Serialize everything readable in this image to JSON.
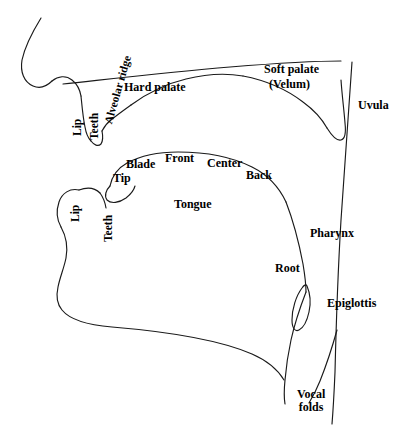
{
  "diagram": {
    "type": "anatomical-line-diagram",
    "background_color": "#ffffff",
    "stroke_color": "#1a1a1a",
    "text_color": "#000000"
  },
  "labels": {
    "alveolar_ridge": "Alveolar ridge",
    "hard_palate": "Hard palate",
    "soft_palate": "Soft palate",
    "velum": "(Velum)",
    "uvula": "Uvula",
    "upper_lip": "Lip",
    "upper_teeth": "Teeth",
    "lower_lip": "Lip",
    "lower_teeth": "Teeth",
    "tip": "Tip",
    "blade": "Blade",
    "front": "Front",
    "center": "Center",
    "back": "Back",
    "tongue": "Tongue",
    "pharynx": "Pharynx",
    "root": "Root",
    "epiglottis": "Epiglottis",
    "vocal_folds_line1": "Vocal",
    "vocal_folds_line2": "folds"
  },
  "structures": [
    "upper-face-profile",
    "upper-lip",
    "upper-teeth",
    "alveolar-ridge",
    "hard-palate",
    "soft-palate-velum",
    "uvula",
    "pharyngeal-wall",
    "tongue-body",
    "lower-lip",
    "lower-teeth",
    "jaw-floor",
    "epiglottis",
    "larynx-vocal-folds"
  ]
}
